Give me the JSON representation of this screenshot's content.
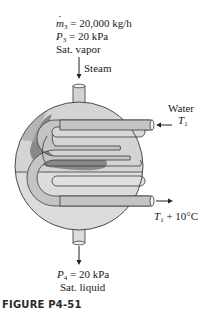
{
  "inlet_steam": {
    "mass_flow_symbol": "m",
    "mass_flow_sub": "3",
    "mass_flow_value": "= 20,000 kg/h",
    "pressure_symbol": "P",
    "pressure_sub": "3",
    "pressure_value": "= 20 kPa",
    "state": "Sat. vapor",
    "stream_label": "Steam"
  },
  "cooling_water_in": {
    "label": "Water",
    "temp_symbol": "T",
    "temp_sub": "1"
  },
  "cooling_water_out": {
    "temp_symbol": "T",
    "temp_sub": "1",
    "temp_suffix": "+ 10°C"
  },
  "outlet_condensate": {
    "pressure_symbol": "P",
    "pressure_sub": "4",
    "pressure_value": "= 20 kPa",
    "state": "Sat. liquid"
  },
  "caption": "FIGURE P4-51",
  "colors": {
    "vessel_fill": "#d4d4d4",
    "vessel_lower_fill": "#dcdcdc",
    "tube_fill": "#c4c4c4",
    "steam_shade": "#7a7a7a",
    "outline": "#3a3a3a"
  }
}
